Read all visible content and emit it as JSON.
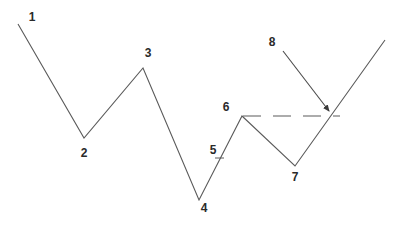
{
  "diagram": {
    "type": "wave-pattern",
    "colors": {
      "line": "#5a5a5a",
      "label": "#2a2a2a",
      "background": "#ffffff"
    },
    "points": [
      {
        "id": "1",
        "x": 18,
        "y": 24
      },
      {
        "id": "2",
        "x": 84,
        "y": 138
      },
      {
        "id": "3",
        "x": 143,
        "y": 68
      },
      {
        "id": "4",
        "x": 199,
        "y": 200
      },
      {
        "id": "6",
        "x": 242,
        "y": 116
      },
      {
        "id": "7",
        "x": 295,
        "y": 166
      },
      {
        "id": "end",
        "x": 385,
        "y": 40
      }
    ],
    "dashed_level": {
      "x1": 243,
      "y1": 116,
      "x2": 340,
      "y2": 116
    },
    "arrow": {
      "x1": 283,
      "y1": 51,
      "x2": 329,
      "y2": 111
    },
    "tick": {
      "x1": 215,
      "y1": 158,
      "x2": 224,
      "y2": 158
    },
    "labels": [
      {
        "text": "1",
        "x": 32,
        "y": 17
      },
      {
        "text": "2",
        "x": 84,
        "y": 153
      },
      {
        "text": "3",
        "x": 148,
        "y": 53
      },
      {
        "text": "4",
        "x": 204,
        "y": 208
      },
      {
        "text": "5",
        "x": 213,
        "y": 150
      },
      {
        "text": "6",
        "x": 226,
        "y": 107
      },
      {
        "text": "7",
        "x": 295,
        "y": 177
      },
      {
        "text": "8",
        "x": 272,
        "y": 42
      }
    ]
  }
}
